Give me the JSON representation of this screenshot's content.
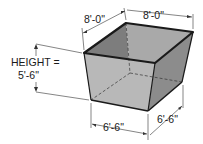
{
  "diagram": {
    "type": "isometric-frustum-bin",
    "labels": {
      "top_left_width": "8'-0\"",
      "top_right_width": "8'-0\"",
      "height_title": "HEIGHT =",
      "height_value": "5'-6\"",
      "bottom_front_width": "6'-6\"",
      "bottom_right_width": "6'-6\""
    },
    "colors": {
      "background": "#ffffff",
      "outline": "#1a1a1a",
      "inner_back_left": "#7a7a7a",
      "inner_back_right": "#a8a8a8",
      "outer_left_face": "#b5b5b5",
      "outer_right_face": "#8a8a8a",
      "dimension_line": "#333333"
    }
  }
}
